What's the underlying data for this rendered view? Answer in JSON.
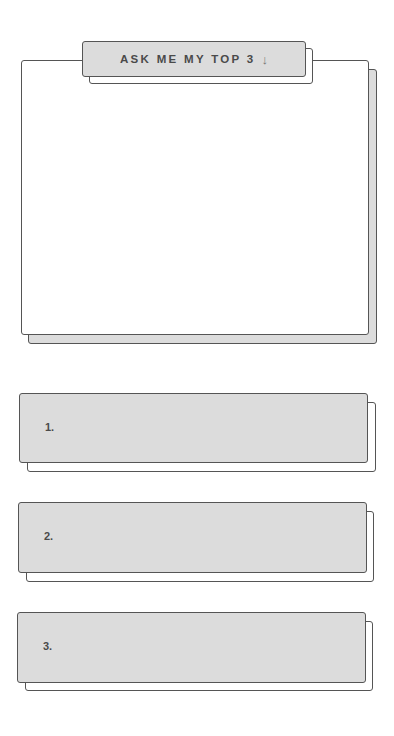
{
  "title_tab": {
    "label": "ASK ME MY TOP 3",
    "arrow_icon": "down-arrow-icon",
    "arrow_glyph": "↓"
  },
  "answer_panel": {
    "content": ""
  },
  "ranked_items": [
    {
      "number": "1.",
      "text": ""
    },
    {
      "number": "2.",
      "text": ""
    },
    {
      "number": "3.",
      "text": ""
    }
  ],
  "colors": {
    "fill_gray": "#dcdcdc",
    "outline": "#555555",
    "text": "#4a4a4a",
    "background": "#ffffff"
  }
}
